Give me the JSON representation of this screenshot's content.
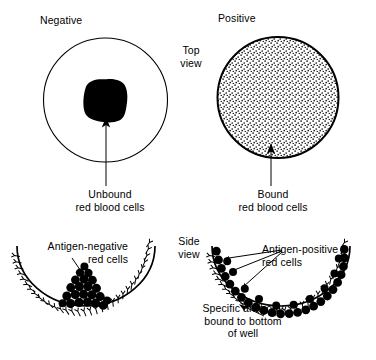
{
  "figure": {
    "kind": "hemagglutination-assay-diagram",
    "width": 376,
    "height": 360,
    "background": "#ffffff",
    "ink": "#000000"
  },
  "titles": {
    "negative": "Negative",
    "positive": "Positive"
  },
  "views": {
    "top": "Top\nview",
    "side": "Side\nview"
  },
  "top_view": {
    "negative_well": {
      "label": "Unbound\nred blood cells",
      "appearance": "open circle with dark irregular pellet at center",
      "circle": {
        "cx": 105.5,
        "cy": 100,
        "r": 62,
        "stroke_width": 1.1,
        "fill": "#ffffff"
      },
      "pellet": {
        "cx": 106,
        "cy": 100,
        "rx": 20,
        "ry": 21,
        "fill": "#000000"
      },
      "arrow": {
        "x": 106,
        "y_from": 186,
        "y_to": 122
      }
    },
    "positive_well": {
      "label": "Bound\nred blood cells",
      "appearance": "circle filled with fine stipple texture",
      "circle": {
        "cx": 278,
        "cy": 97.5,
        "r": 60.5,
        "stroke_width": 2.0,
        "fill": "stipple"
      },
      "arrow": {
        "x": 271,
        "y_from": 186,
        "y_to": 149
      }
    }
  },
  "side_view": {
    "negative_well": {
      "label": "Antigen-negative\nred cells",
      "description": "U-shaped well coated with specific antibody; unbound red cells settle as a pellet at the bottom center",
      "arc": {
        "cx": 86,
        "cy": 246,
        "rx": 69,
        "ry": 60,
        "stroke_width": 1.6
      },
      "antibody_count": 40,
      "cell_cluster": {
        "cx": 86,
        "cy": 295,
        "count": 22
      },
      "leader": {
        "x1": 74,
        "y1": 262,
        "x2": 90,
        "y2": 285
      }
    },
    "positive_well": {
      "label": "Antigen-positive\nred cells",
      "description": "U-shaped well coated with specific antibody; antigen-positive red cells bind across the whole coated surface forming an even carpet",
      "arc": {
        "cx": 281,
        "cy": 246,
        "rx": 69,
        "ry": 60,
        "stroke_width": 1.6
      },
      "antibody_count": 40,
      "bound_cell_count": 34,
      "leaders": 3
    },
    "antibody_caption": "Specific antibody\nbound to bottom\nof well"
  },
  "icons": {
    "arrow": "arrowhead-up",
    "antibody": "y-shaped-antibody",
    "cell": "filled-circle-red-blood-cell"
  }
}
